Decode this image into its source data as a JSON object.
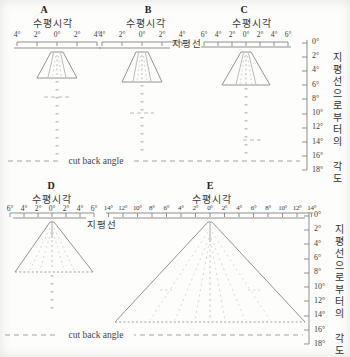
{
  "top": {
    "panels": [
      {
        "title": "A",
        "subtitle": "수평시각",
        "ticks": [
          "4°",
          "2°",
          "0°",
          "2°",
          "4°"
        ]
      },
      {
        "title": "B",
        "subtitle": "수평시각",
        "ticks": [
          "4°",
          "2°",
          "0°",
          "2°",
          "4°"
        ]
      },
      {
        "title": "C",
        "subtitle": "수평시각",
        "ticks": [
          "6°",
          "4°",
          "2°",
          "0°",
          "2°",
          "4°",
          "6°"
        ]
      }
    ],
    "horizon_label": "지평선",
    "cutback_label": "cut back angle",
    "vaxis": {
      "labels": [
        "0°",
        "2°",
        "4°",
        "6°",
        "8°",
        "10°",
        "12°",
        "14°",
        "16°",
        "18°"
      ],
      "title": "지평선으로부터의 각도"
    }
  },
  "bottom": {
    "panels": [
      {
        "title": "D",
        "subtitle": "수평시각",
        "ticks": [
          "6°",
          "4°",
          "2°",
          "0°",
          "2°",
          "4°",
          "6°"
        ]
      },
      {
        "title": "E",
        "subtitle": "수평시각",
        "ticks": [
          "14°",
          "12°",
          "10°",
          "8°",
          "6°",
          "4°",
          "2°",
          "0°",
          "2°",
          "4°",
          "6°",
          "8°",
          "10°",
          "12°",
          "14°"
        ]
      }
    ],
    "horizon_label": "지평선",
    "cutback_label": "cut back angle",
    "vaxis": {
      "labels": [
        "0°",
        "2°",
        "4°",
        "6°",
        "8°",
        "10°",
        "12°",
        "14°",
        "16°",
        "18°"
      ],
      "title": "지평선으로부터의 각도"
    }
  }
}
